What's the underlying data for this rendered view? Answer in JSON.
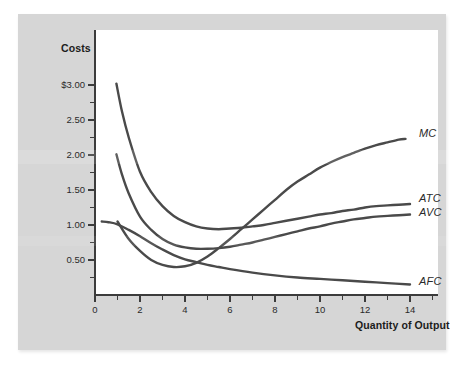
{
  "figure": {
    "background_color": "#d6d6d6",
    "plot_background_color": "#ffffff",
    "curve_color": "#4a4a4a",
    "axis_color": "#3c3c3c"
  },
  "chart_data": {
    "type": "line",
    "title": "",
    "subtitle": "",
    "xlabel": "Quantity of Output",
    "ylabel": "Costs",
    "xlim": [
      0,
      15.2
    ],
    "ylim": [
      0,
      3.35
    ],
    "grid": false,
    "legend_position": "right-inline-labels",
    "x_ticks": [
      0,
      2,
      4,
      6,
      8,
      10,
      12,
      14
    ],
    "x_tick_labels": [
      "0",
      "2",
      "4",
      "6",
      "8",
      "10",
      "12",
      "14"
    ],
    "x_minor_ticks": [
      1,
      3,
      5,
      7,
      9,
      11,
      13,
      15
    ],
    "y_ticks": [
      0.5,
      1.0,
      1.5,
      2.0,
      2.5,
      3.0
    ],
    "y_tick_labels": [
      "0.50",
      "1.00",
      "1.50",
      "2.00",
      "2.50",
      "$3.00"
    ],
    "y_minor_ticks": [
      0.25,
      0.75,
      1.25,
      1.75,
      2.25,
      2.75
    ],
    "series": [
      {
        "name": "MC",
        "label": "MC",
        "color": "#4a4a4a",
        "x": [
          1.0,
          1.5,
          2.0,
          2.5,
          3.0,
          3.5,
          4.0,
          4.5,
          5.0,
          5.5,
          6.0,
          6.5,
          7.0,
          7.5,
          8.0,
          8.5,
          9.0,
          9.5,
          10.0,
          10.5,
          11.0,
          11.5,
          12.0,
          12.5,
          13.0,
          13.5,
          13.8
        ],
        "y": [
          1.05,
          0.8,
          0.63,
          0.5,
          0.43,
          0.4,
          0.41,
          0.46,
          0.55,
          0.67,
          0.8,
          0.94,
          1.08,
          1.22,
          1.36,
          1.5,
          1.62,
          1.72,
          1.82,
          1.9,
          1.97,
          2.03,
          2.09,
          2.14,
          2.18,
          2.22,
          2.23
        ]
      },
      {
        "name": "ATC",
        "label": "ATC",
        "color": "#4a4a4a",
        "x": [
          0.95,
          1.2,
          1.5,
          2.0,
          2.5,
          3.0,
          3.5,
          4.0,
          4.5,
          5.0,
          5.5,
          6.0,
          6.5,
          7.0,
          7.5,
          8.0,
          8.5,
          9.0,
          9.5,
          10.0,
          10.5,
          11.0,
          11.5,
          12.0,
          12.5,
          13.0,
          13.5,
          14.0
        ],
        "y": [
          3.02,
          2.62,
          2.25,
          1.76,
          1.47,
          1.27,
          1.13,
          1.04,
          0.98,
          0.95,
          0.94,
          0.95,
          0.96,
          0.98,
          1.0,
          1.03,
          1.06,
          1.09,
          1.12,
          1.15,
          1.17,
          1.2,
          1.22,
          1.25,
          1.27,
          1.28,
          1.29,
          1.3
        ]
      },
      {
        "name": "AVC",
        "label": "AVC",
        "color": "#4a4a4a",
        "x": [
          0.95,
          1.2,
          1.5,
          2.0,
          2.5,
          3.0,
          3.5,
          4.0,
          4.5,
          5.0,
          5.5,
          6.0,
          6.5,
          7.0,
          7.5,
          8.0,
          8.5,
          9.0,
          9.5,
          10.0,
          10.5,
          11.0,
          11.5,
          12.0,
          12.5,
          13.0,
          13.5,
          14.0
        ],
        "y": [
          2.01,
          1.72,
          1.45,
          1.12,
          0.93,
          0.8,
          0.72,
          0.68,
          0.66,
          0.66,
          0.67,
          0.69,
          0.72,
          0.75,
          0.79,
          0.83,
          0.87,
          0.91,
          0.95,
          0.98,
          1.02,
          1.05,
          1.08,
          1.1,
          1.12,
          1.13,
          1.14,
          1.15
        ]
      },
      {
        "name": "AFC",
        "label": "AFC",
        "color": "#4a4a4a",
        "x": [
          0.3,
          0.6,
          1.0,
          1.5,
          2.0,
          2.5,
          3.0,
          3.5,
          4.0,
          4.5,
          5.0,
          5.5,
          6.0,
          7.0,
          8.0,
          9.0,
          10.0,
          11.0,
          12.0,
          13.0,
          14.0
        ],
        "y": [
          1.05,
          1.04,
          1.01,
          0.93,
          0.84,
          0.74,
          0.65,
          0.57,
          0.51,
          0.47,
          0.43,
          0.4,
          0.37,
          0.32,
          0.28,
          0.25,
          0.23,
          0.21,
          0.19,
          0.17,
          0.15
        ]
      }
    ],
    "annotations": [
      {
        "text": "MC",
        "x": 14.4,
        "y": 2.3
      },
      {
        "text": "ATC",
        "x": 14.4,
        "y": 1.37
      },
      {
        "text": "AVC",
        "x": 14.4,
        "y": 1.17
      },
      {
        "text": "AFC",
        "x": 14.4,
        "y": 0.18
      }
    ]
  }
}
